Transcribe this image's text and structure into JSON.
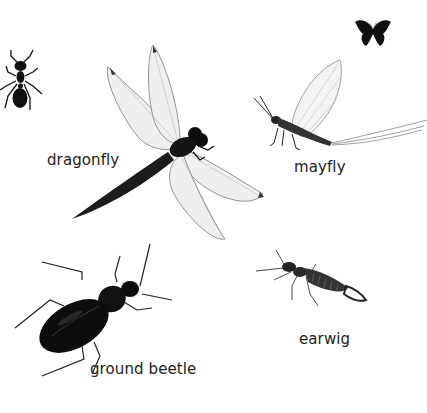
{
  "colors": {
    "background": "#ffffff",
    "label_text": "#222222",
    "insect_body": "#111111",
    "wing_fill": "#eeeeee",
    "wing_vein": "#8a8a8a"
  },
  "icons": {
    "butterfly": "butterfly-icon"
  },
  "insects": {
    "ant": {
      "label": ""
    },
    "dragonfly": {
      "label": "dragonfly"
    },
    "mayfly": {
      "label": "mayfly"
    },
    "earwig": {
      "label": "earwig"
    },
    "ground_beetle": {
      "label": "ground beetle"
    }
  }
}
